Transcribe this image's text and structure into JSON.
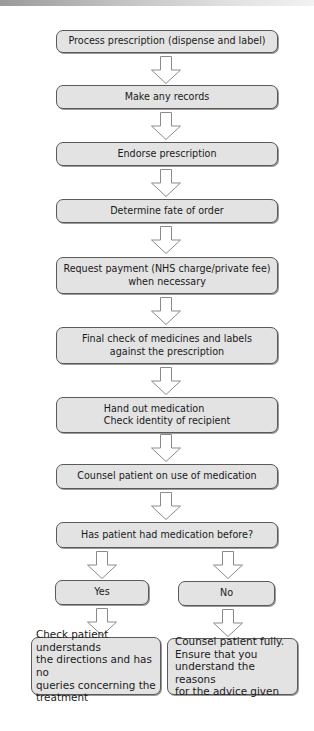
{
  "flowchart": {
    "steps": [
      {
        "label": "Process prescription (dispense and label)"
      },
      {
        "label": "Make any records"
      },
      {
        "label": "Endorse prescription"
      },
      {
        "label": "Determine fate of order"
      },
      {
        "label": "Request payment (NHS charge/private fee)\nwhen necessary"
      },
      {
        "label": "Final check of medicines and labels\nagainst the prescription"
      },
      {
        "label": "Hand out medication\nCheck identity of recipient"
      },
      {
        "label": "Counsel patient on use of medication"
      },
      {
        "label": "Has patient had medication before?"
      }
    ],
    "branches": {
      "yes": {
        "label": "Yes",
        "outcome": "Check patient understands\nthe directions and has no\nqueries concerning the\ntreatment"
      },
      "no": {
        "label": "No",
        "outcome": "Counsel patient fully.\nEnsure that you\nunderstand the reasons\nfor the advice given"
      }
    },
    "colors": {
      "box_fill": "#e3e3e3",
      "box_border": "#5a5a5a",
      "arrow_fill": "#ffffff",
      "arrow_stroke": "#8a8a8a"
    }
  }
}
